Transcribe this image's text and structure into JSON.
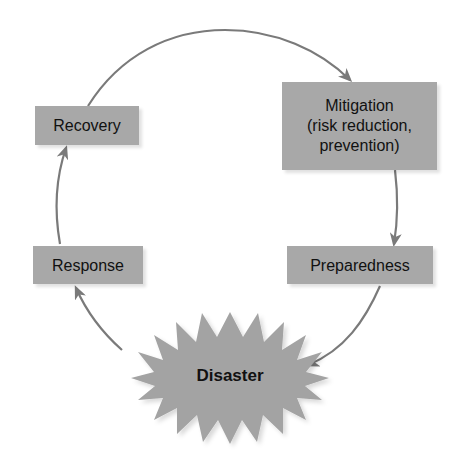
{
  "diagram": {
    "type": "cycle",
    "colors": {
      "box_fill": "#a8a8a8",
      "arrow": "#7a7a7a",
      "burst_fill": "#a3a3a3",
      "text": "#111111"
    },
    "nodes": [
      {
        "id": "mitigation",
        "label": "Mitigation\n(risk reduction,\nprevention)"
      },
      {
        "id": "preparedness",
        "label": "Preparedness"
      },
      {
        "id": "disaster",
        "label": "Disaster"
      },
      {
        "id": "response",
        "label": "Response"
      },
      {
        "id": "recovery",
        "label": "Recovery"
      }
    ],
    "edges": [
      {
        "from": "recovery",
        "to": "mitigation"
      },
      {
        "from": "mitigation",
        "to": "preparedness"
      },
      {
        "from": "preparedness",
        "to": "disaster"
      },
      {
        "from": "disaster",
        "to": "response"
      },
      {
        "from": "response",
        "to": "recovery"
      }
    ]
  },
  "labels": {
    "recovery": "Recovery",
    "mitigation": "Mitigation\n(risk reduction,\nprevention)",
    "response": "Response",
    "preparedness": "Preparedness",
    "disaster": "Disaster"
  }
}
